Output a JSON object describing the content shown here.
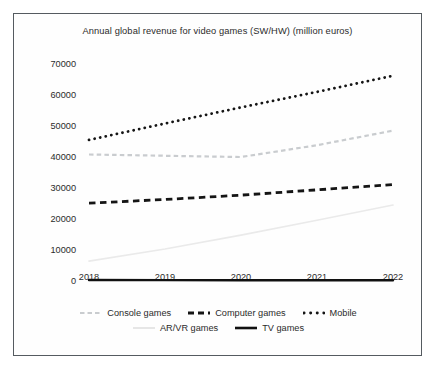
{
  "chart_data": {
    "type": "line",
    "title": "Annual global revenue for video games (SW/HW) (million euros)",
    "xlabel": "",
    "ylabel": "",
    "x": [
      2018,
      2019,
      2020,
      2021,
      2022
    ],
    "categories": [
      "2018",
      "2019",
      "2020",
      "2021",
      "2022"
    ],
    "yticks": [
      0,
      10000,
      20000,
      30000,
      40000,
      50000,
      60000,
      70000
    ],
    "ytick_labels": [
      "0",
      "10000",
      "20000",
      "30000",
      "40000",
      "50000",
      "60000",
      "70000"
    ],
    "ylim": [
      0,
      70000
    ],
    "xlim": [
      2018,
      2022
    ],
    "grid": false,
    "legend_position": "bottom",
    "series": [
      {
        "name": "Console games",
        "values": [
          40800,
          40400,
          40000,
          43800,
          48500
        ],
        "style": "dashed",
        "color": "#c9cccf",
        "width": 2.2
      },
      {
        "name": "Computer games",
        "values": [
          25100,
          26300,
          27700,
          29400,
          31100
        ],
        "style": "dashed",
        "color": "#151515",
        "width": 2.8
      },
      {
        "name": "Mobile",
        "values": [
          45500,
          50800,
          56000,
          61000,
          66200
        ],
        "style": "dotted",
        "color": "#151515",
        "width": 2.8
      },
      {
        "name": "AR/VR games",
        "values": [
          6400,
          10300,
          14800,
          19600,
          24500
        ],
        "style": "solid",
        "color": "#eaeaea",
        "width": 1.6
      },
      {
        "name": "TV games",
        "values": [
          300,
          280,
          260,
          250,
          240
        ],
        "style": "solid",
        "color": "#111111",
        "width": 2.4
      }
    ]
  },
  "legend": {
    "row1": [
      "Console games",
      "Computer games",
      "Mobile"
    ],
    "row2": [
      "AR/VR games",
      "TV games"
    ]
  },
  "colors": {
    "frame": "#555b60",
    "text": "#2b2b2b",
    "console": "#c9cccf",
    "computer": "#151515",
    "mobile": "#151515",
    "arvr": "#eaeaea",
    "tv": "#111111"
  }
}
